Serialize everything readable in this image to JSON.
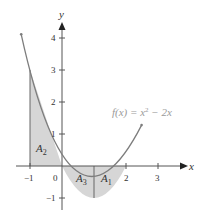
{
  "figure": {
    "function_label": "f(x) = x² − 2x",
    "function_label_parts": {
      "lhs": "f(x) = x",
      "exp": "2",
      "rhs": " − 2x"
    },
    "x_axis_label": "x",
    "y_axis_label": "y",
    "x_ticks": [
      "−1",
      "0",
      "2",
      "3"
    ],
    "y_ticks": [
      "4",
      "3",
      "2",
      "1",
      "−1"
    ],
    "regions": [
      {
        "name": "A2",
        "base": "A",
        "sub": "2",
        "interval": [
          -1,
          0
        ]
      },
      {
        "name": "A3",
        "base": "A",
        "sub": "3",
        "interval": [
          0,
          1
        ]
      },
      {
        "name": "A1",
        "base": "A",
        "sub": "1",
        "interval": [
          1,
          2
        ]
      }
    ],
    "colors": {
      "curve": "#7d7d7d",
      "fill": "#d6d6d6",
      "axis": "#555555",
      "label": "#333333",
      "function_label": "#9a9a9a"
    }
  }
}
